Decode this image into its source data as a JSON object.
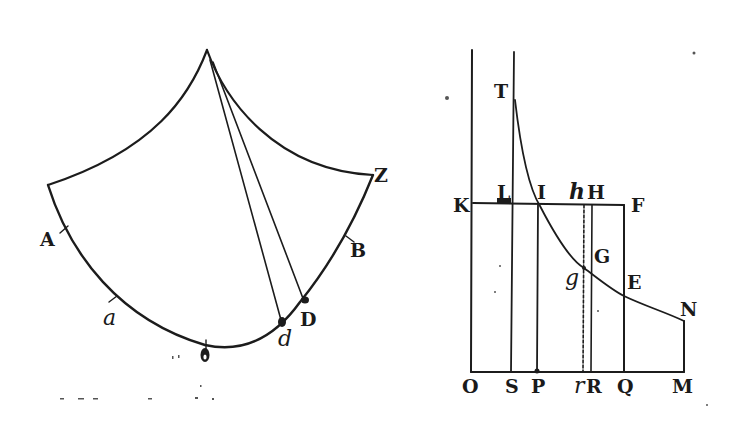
{
  "figure": {
    "colors": {
      "ink": "#1c1c1c",
      "paper": "#ffffff"
    }
  },
  "left_figure": {
    "labels": {
      "A": "A",
      "a": "a",
      "o": "o",
      "d": "d",
      "D": "D",
      "B": "B",
      "Z": "Z"
    }
  },
  "right_figure": {
    "labels": {
      "T": "T",
      "K": "K",
      "L": "L",
      "I": "I",
      "h": "h",
      "H": "H",
      "F": "F",
      "G": "G",
      "g": "g",
      "E": "E",
      "N": "N",
      "O": "O",
      "S": "S",
      "P": "P",
      "r": "r",
      "R": "R",
      "Q": "Q",
      "M": "M"
    }
  }
}
